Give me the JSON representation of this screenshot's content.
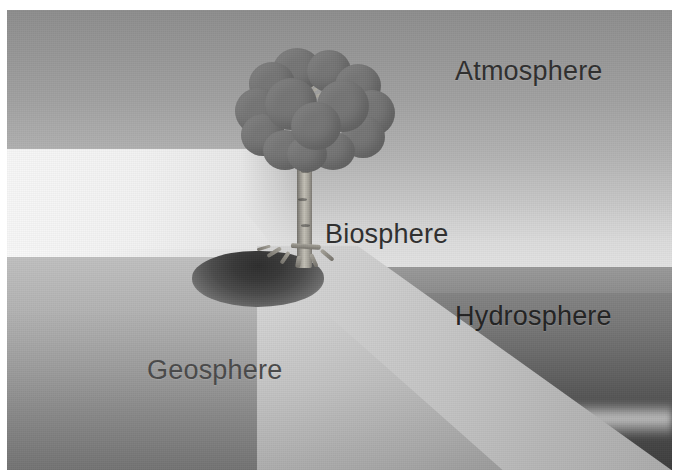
{
  "figure": {
    "background_color": "#ffffff",
    "frame": {
      "left": 7,
      "top": 10,
      "width": 665,
      "height": 460
    }
  },
  "labels": {
    "atmosphere": "Atmosphere",
    "biosphere": "Biosphere",
    "hydrosphere": "Hydrosphere",
    "geosphere": "Geosphere"
  },
  "scene": {
    "sky": {
      "name": "atmosphere-sky",
      "color_top": "#8e8e8e",
      "color_horizon": "#e6e6e6"
    },
    "sun": {
      "name": "sun-dome",
      "color_core": "#fbfbfb",
      "color_edge": "#cfcfcf"
    },
    "water": {
      "name": "hydrosphere-water",
      "color_near_horizon": "#8b8b8b",
      "color_deep": "#3e3e3e"
    },
    "land": {
      "name": "geosphere-land",
      "color_light": "#d6d6d6",
      "color_dark": "#767676"
    },
    "hollow": {
      "name": "ground-hollow-shadow",
      "color": "#2e2e2e"
    },
    "tree": {
      "name": "biosphere-tree",
      "canopy_color": "#767676",
      "trunk_color": "#c3c0b6",
      "canopy_blob_count": 15,
      "branch_count": 9,
      "root_count": 6
    }
  },
  "palette": {
    "ink": "#2f2f2f",
    "paper": "#ffffff",
    "sky_top": "#8e8e8e",
    "sky_bottom": "#e6e6e6",
    "water_top": "#8b8b8b",
    "water_bottom": "#3e3e3e",
    "land_light": "#d6d6d6",
    "land_dark": "#767676",
    "canopy": "#767676",
    "trunk": "#c3c0b6"
  }
}
